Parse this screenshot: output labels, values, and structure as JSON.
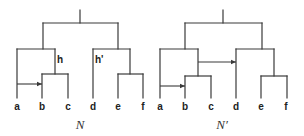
{
  "figure": {
    "type": "phylogenetic-networks",
    "line_color": "#3a3a3a",
    "networks": [
      {
        "id": "N",
        "caption": "N",
        "leaves": [
          "a",
          "b",
          "c",
          "d",
          "e",
          "f"
        ],
        "internal_labels": {
          "h": "h",
          "h_prime": "h'"
        },
        "reticulations": [
          {
            "from": "a",
            "to": "b"
          }
        ]
      },
      {
        "id": "N_prime",
        "caption": "N′",
        "leaves": [
          "a",
          "b",
          "c",
          "d",
          "e",
          "f"
        ],
        "reticulations": [
          {
            "from": "a",
            "to": "b"
          },
          {
            "from": "parent of (b,c)",
            "to": "d"
          }
        ]
      }
    ]
  }
}
